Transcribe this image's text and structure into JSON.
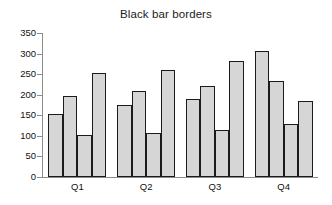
{
  "chart_data": {
    "type": "bar",
    "title": "Black bar borders",
    "xlabel": "",
    "ylabel": "",
    "ylim": [
      0,
      350
    ],
    "ytick_step": 50,
    "yticks": [
      0,
      50,
      100,
      150,
      200,
      250,
      300,
      350
    ],
    "grid": false,
    "legend": false,
    "categories": [
      "Q1",
      "Q2",
      "Q3",
      "Q4"
    ],
    "series": [
      {
        "name": "Series 1",
        "values": [
          152,
          176,
          189,
          307
        ]
      },
      {
        "name": "Series 2",
        "values": [
          196,
          208,
          222,
          234
        ]
      },
      {
        "name": "Series 3",
        "values": [
          103,
          107,
          114,
          129
        ]
      },
      {
        "name": "Series 4",
        "values": [
          252,
          260,
          283,
          185
        ]
      }
    ],
    "bar_fill_color": "#d6d6d6",
    "bar_border_color": "#1b1b1b",
    "axis_color": "#8c8c8c",
    "text_color": "#111111",
    "background_color": "#ffffff"
  }
}
